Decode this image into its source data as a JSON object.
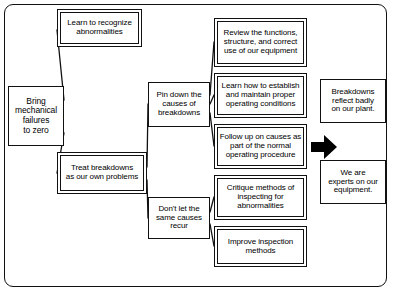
{
  "diagram": {
    "title": "Bring mechanical failures to zero",
    "type": "tree-diagram",
    "colors": {
      "background": "#ffffff",
      "line": "#111111",
      "text": "#000000",
      "arrow": "#000000"
    },
    "frame": {
      "name": "outer-rounded-frame",
      "style": "rounded-rectangle"
    },
    "nodes": {
      "goal": "Bring\nmechanical\nfailures\nto zero",
      "learn_recognize": "Learn to recognize\nabnormalities",
      "treat_breakdowns": "Treat breakdowns\nas our own problems",
      "pin_down": "Pin down the\ncauses of\nbreakdowns",
      "dont_recur": "Don't let the\nsame causes\nrecur",
      "review_functions": "Review the functions,\nstructure, and correct\nuse of our equipment",
      "establish_conditions": "Learn how to establish\nand maintain proper\noperating conditions",
      "follow_up": "Follow up on causes as\npart of the normal\noperating procedure",
      "critique_methods": "Critique methods of\ninspecting for\nabnormalities",
      "improve_inspection": "Improve inspection\nmethods",
      "reflect_badly": "Breakdowns\nreflect badly\non our plant.",
      "we_are_experts": "We are\nexperts on our\nequipment."
    },
    "arrow": {
      "name": "bold-right-arrow",
      "direction": "right"
    },
    "connections": [
      {
        "from": "goal",
        "to": "learn_recognize"
      },
      {
        "from": "goal",
        "to": "treat_breakdowns"
      },
      {
        "from": "treat_breakdowns",
        "to": "pin_down"
      },
      {
        "from": "treat_breakdowns",
        "to": "dont_recur"
      },
      {
        "from": "pin_down",
        "to": "review_functions"
      },
      {
        "from": "pin_down",
        "to": "establish_conditions"
      },
      {
        "from": "pin_down",
        "to": "follow_up"
      },
      {
        "from": "dont_recur",
        "to": "critique_methods"
      },
      {
        "from": "dont_recur",
        "to": "improve_inspection"
      }
    ]
  }
}
